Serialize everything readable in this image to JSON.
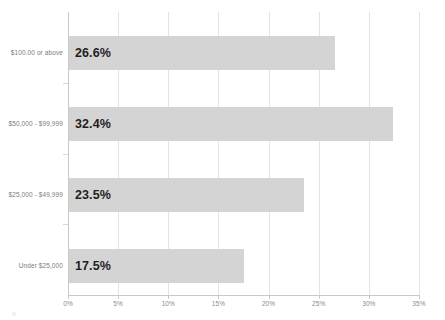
{
  "chart_data": {
    "type": "bar",
    "orientation": "horizontal",
    "title": "",
    "xlabel": "",
    "ylabel": "",
    "categories": [
      "Under $25,000",
      "$25,000 - $49,999",
      "$50,000 - $99,999",
      "$100.00 or above"
    ],
    "values": [
      17.5,
      23.5,
      32.4,
      26.6
    ],
    "value_labels": [
      "17.5%",
      "23.5%",
      "32.4%",
      "26.6%"
    ],
    "xlim": [
      0,
      35
    ],
    "xticks": [
      0,
      5,
      10,
      15,
      20,
      25,
      30,
      35
    ],
    "xtick_labels": [
      "0%",
      "5%",
      "10%",
      "15%",
      "20%",
      "25%",
      "30%",
      "35%"
    ],
    "grid": true,
    "grid_axis": "x",
    "legend": false,
    "bar_color": "#d4d4d4",
    "grid_color": "#e3e3e3",
    "axis_color": "#c9c9c9",
    "label_color": "#7d7d7d",
    "value_label_color": "#1f1f1f"
  },
  "bars": [
    {
      "category": "$100.00 or above",
      "value": 26.6,
      "label": "26.6%"
    },
    {
      "category": "$50,000 - $99,999",
      "value": 32.4,
      "label": "32.4%"
    },
    {
      "category": "$25,000 - $49,999",
      "value": 23.5,
      "label": "23.5%"
    },
    {
      "category": "Under $25,000",
      "value": 17.5,
      "label": "17.5%"
    }
  ],
  "xaxis": {
    "ticks": [
      {
        "label": "0%",
        "value": 0
      },
      {
        "label": "5%",
        "value": 5
      },
      {
        "label": "10%",
        "value": 10
      },
      {
        "label": "15%",
        "value": 15
      },
      {
        "label": "20%",
        "value": 20
      },
      {
        "label": "25%",
        "value": 25
      },
      {
        "label": "30%",
        "value": 30
      },
      {
        "label": "35%",
        "value": 35
      }
    ]
  }
}
